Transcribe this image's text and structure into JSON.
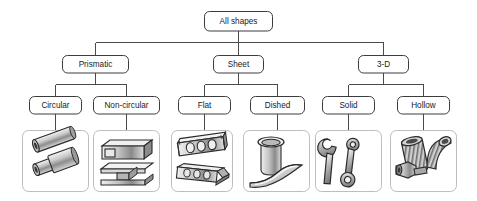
{
  "diagram": {
    "colors": {
      "background": "#ffffff",
      "node_stroke": "#3c3c3c",
      "node_fill": "#ffffff",
      "connector": "#4a4a4a",
      "panel_stroke": "#bdbdbd",
      "text": "#1a1a1a",
      "art_dark": "#2b2b2b",
      "art_mid": "#9a9a9a",
      "art_light": "#e2e2e2"
    },
    "levels": [
      {
        "level": 1,
        "nodes": [
          {
            "id": "all-shapes",
            "label": "All shapes"
          }
        ]
      },
      {
        "level": 2,
        "nodes": [
          {
            "id": "prismatic",
            "label": "Prismatic"
          },
          {
            "id": "sheet",
            "label": "Sheet"
          },
          {
            "id": "three-d",
            "label": "3-D"
          }
        ]
      },
      {
        "level": 3,
        "nodes": [
          {
            "id": "circular",
            "label": "Circular",
            "parent": "prismatic"
          },
          {
            "id": "non-circular",
            "label": "Non-circular",
            "parent": "prismatic"
          },
          {
            "id": "flat",
            "label": "Flat",
            "parent": "sheet"
          },
          {
            "id": "dished",
            "label": "Dished",
            "parent": "sheet"
          },
          {
            "id": "solid",
            "label": "Solid",
            "parent": "three-d"
          },
          {
            "id": "hollow",
            "label": "Hollow",
            "parent": "three-d"
          }
        ]
      }
    ],
    "example_panels": [
      {
        "id": "panel-circular",
        "parent": "circular",
        "caption": "",
        "icon": "round-tubes-illustration"
      },
      {
        "id": "panel-non-circular",
        "parent": "non-circular",
        "caption": "",
        "icon": "box-section-and-i-beam-illustration"
      },
      {
        "id": "panel-flat",
        "parent": "flat",
        "caption": "",
        "icon": "perforated-flat-strips-illustration"
      },
      {
        "id": "panel-dished",
        "parent": "dished",
        "caption": "",
        "icon": "cup-and-curved-sheet-illustration"
      },
      {
        "id": "panel-solid",
        "parent": "solid",
        "caption": "",
        "icon": "spanner-and-conrod-illustration"
      },
      {
        "id": "panel-hollow",
        "parent": "hollow",
        "caption": "",
        "icon": "hollow-pipe-fittings-illustration"
      }
    ]
  }
}
